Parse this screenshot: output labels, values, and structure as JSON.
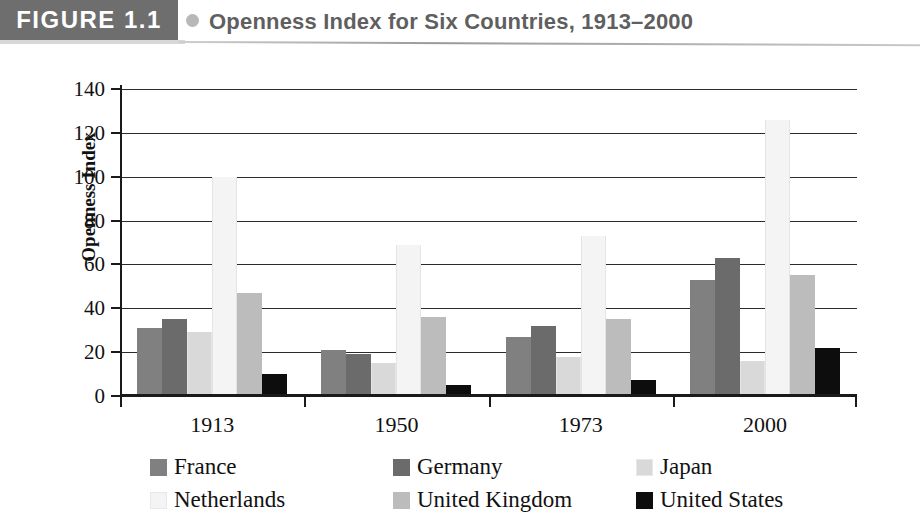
{
  "header": {
    "figure_tag": "FIGURE 1.1",
    "bullet_icon": "circle-bullet-icon",
    "title": "Openness Index for Six Countries, 1913–2000",
    "tag_bg_color": "#6e6e6e",
    "title_color": "#5f5f5f"
  },
  "chart_data": {
    "type": "bar",
    "title": "Openness Index for Six Countries, 1913–2000",
    "xlabel": "",
    "ylabel": "Openness Index",
    "categories": [
      "1913",
      "1950",
      "1973",
      "2000"
    ],
    "ylim": [
      0,
      140
    ],
    "yticks": [
      0,
      20,
      40,
      60,
      80,
      100,
      120,
      140
    ],
    "ytick_labels": [
      "0",
      "20",
      "40",
      "60",
      "80",
      "100",
      "120",
      "140"
    ],
    "grid": true,
    "legend_position": "bottom",
    "series": [
      {
        "name": "France",
        "color": "#808080",
        "values": [
          31,
          21,
          27,
          53
        ]
      },
      {
        "name": "Germany",
        "color": "#6b6b6b",
        "values": [
          35,
          19,
          32,
          63
        ]
      },
      {
        "name": "Japan",
        "color": "#d9d9d9",
        "values": [
          29,
          15,
          18,
          16
        ]
      },
      {
        "name": "Netherlands",
        "color": "#f4f4f4",
        "values": [
          100,
          69,
          73,
          126
        ]
      },
      {
        "name": "United Kingdom",
        "color": "#bcbcbc",
        "values": [
          47,
          36,
          35,
          55
        ]
      },
      {
        "name": "United States",
        "color": "#0d0d0d",
        "values": [
          10,
          5,
          7.5,
          22
        ]
      }
    ]
  },
  "legend": {
    "rows": [
      [
        {
          "label": "France",
          "color": "#808080"
        },
        {
          "label": "Germany",
          "color": "#6b6b6b"
        },
        {
          "label": "Japan",
          "color": "#d9d9d9"
        }
      ],
      [
        {
          "label": "Netherlands",
          "color": "#f4f4f4"
        },
        {
          "label": "United Kingdom",
          "color": "#bcbcbc"
        },
        {
          "label": "United States",
          "color": "#0d0d0d"
        }
      ]
    ]
  }
}
